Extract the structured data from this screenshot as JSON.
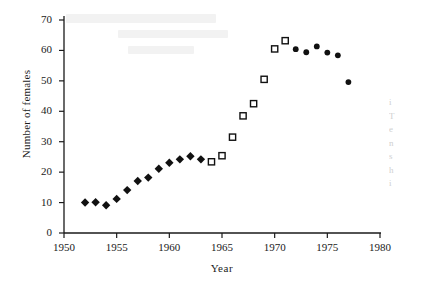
{
  "figure": {
    "ylabel": "Number of females",
    "xlabel": "Year"
  },
  "side_column_text": [
    "i",
    "T",
    "e",
    "n",
    "s",
    "h",
    "i"
  ],
  "chart_data": {
    "type": "scatter",
    "title": "",
    "xlabel": "Year",
    "ylabel": "Number of females",
    "xlim": [
      1950,
      1980
    ],
    "ylim": [
      0,
      70
    ],
    "xticks": [
      1950,
      1955,
      1960,
      1965,
      1970,
      1975,
      1980
    ],
    "xtick_labels": [
      "1950",
      "1955",
      "1960",
      "1965",
      "1970",
      "1975",
      "1980"
    ],
    "yticks": [
      0,
      10,
      20,
      30,
      40,
      50,
      60,
      70
    ],
    "ytick_labels": [
      "0",
      "10",
      "20",
      "30",
      "40",
      "50",
      "60",
      "70"
    ],
    "grid": false,
    "legend": "none",
    "series": [
      {
        "name": "early period",
        "marker": "filled-diamond",
        "color": "#111111",
        "points": [
          {
            "x": 1952,
            "y": 10.0
          },
          {
            "x": 1953,
            "y": 10.1
          },
          {
            "x": 1954,
            "y": 9.1
          },
          {
            "x": 1955,
            "y": 11.2
          },
          {
            "x": 1956,
            "y": 14.1
          },
          {
            "x": 1957,
            "y": 17.1
          },
          {
            "x": 1958,
            "y": 18.2
          },
          {
            "x": 1959,
            "y": 21.1
          },
          {
            "x": 1960,
            "y": 23.1
          },
          {
            "x": 1961,
            "y": 24.2
          },
          {
            "x": 1962,
            "y": 25.2
          },
          {
            "x": 1963,
            "y": 24.2
          }
        ]
      },
      {
        "name": "middle period",
        "marker": "open-square",
        "color": "#111111",
        "points": [
          {
            "x": 1964,
            "y": 23.4
          },
          {
            "x": 1965,
            "y": 25.4
          },
          {
            "x": 1966,
            "y": 31.5
          },
          {
            "x": 1967,
            "y": 38.5
          },
          {
            "x": 1968,
            "y": 42.5
          },
          {
            "x": 1969,
            "y": 50.5
          },
          {
            "x": 1970,
            "y": 60.5
          },
          {
            "x": 1971,
            "y": 63.2
          }
        ]
      },
      {
        "name": "late period",
        "marker": "filled-circle",
        "color": "#111111",
        "points": [
          {
            "x": 1972,
            "y": 60.4
          },
          {
            "x": 1973,
            "y": 59.4
          },
          {
            "x": 1974,
            "y": 61.3
          },
          {
            "x": 1975,
            "y": 59.3
          },
          {
            "x": 1976,
            "y": 58.4
          },
          {
            "x": 1977,
            "y": 49.6
          }
        ]
      }
    ]
  }
}
